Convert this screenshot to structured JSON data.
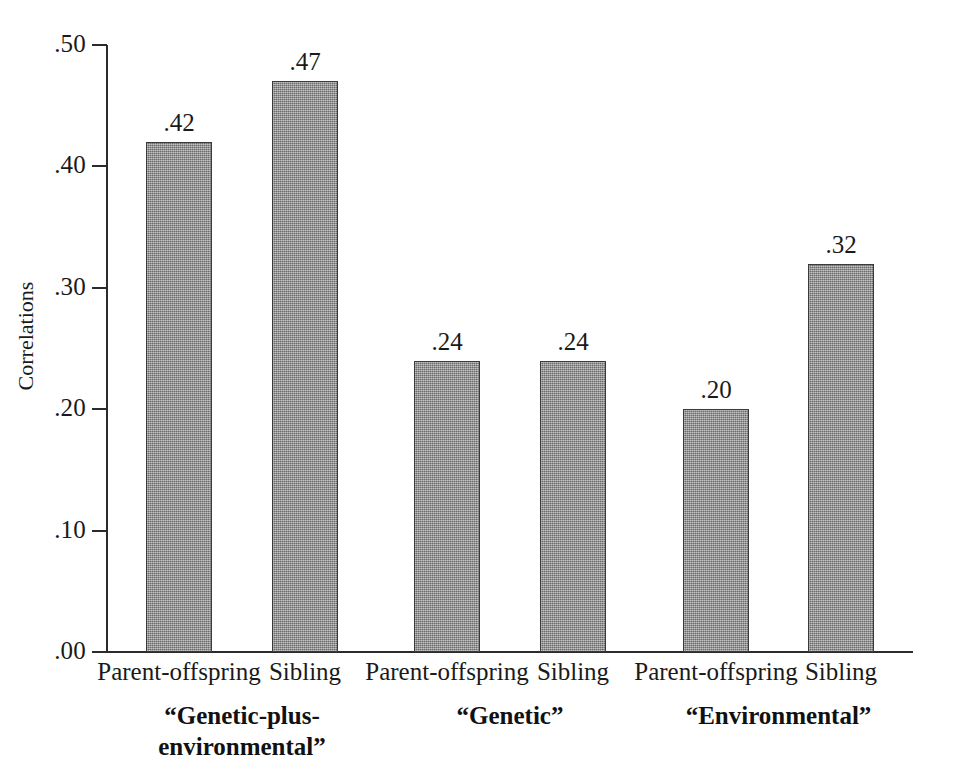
{
  "chart_data": {
    "type": "bar",
    "title": "",
    "subtitle": "",
    "xlabel": "",
    "ylabel": "Correlations",
    "ylim": [
      0.0,
      0.5
    ],
    "ytick_labels": [
      ".50",
      ".40",
      ".30",
      ".20",
      ".10",
      ".00"
    ],
    "ytick_values": [
      0.5,
      0.4,
      0.3,
      0.2,
      0.1,
      0.0
    ],
    "grid": false,
    "legend": "none",
    "categories": [
      "Parent-offspring",
      "Sibling",
      "Parent-offspring",
      "Sibling",
      "Parent-offspring",
      "Sibling"
    ],
    "values": [
      0.42,
      0.47,
      0.24,
      0.24,
      0.2,
      0.32
    ],
    "value_labels": [
      ".42",
      ".47",
      ".24",
      ".24",
      ".20",
      ".32"
    ],
    "groups": [
      {
        "label": "“Genetic-plus-\nenvironmental”",
        "label_line1": "“Genetic-plus-",
        "label_line2": "environmental”",
        "bars": [
          {
            "category": "Parent-offspring",
            "value": 0.42,
            "label": ".42"
          },
          {
            "category": "Sibling",
            "value": 0.47,
            "label": ".47"
          }
        ]
      },
      {
        "label": "“Genetic”",
        "label_line1": "“Genetic”",
        "label_line2": "",
        "bars": [
          {
            "category": "Parent-offspring",
            "value": 0.24,
            "label": ".24"
          },
          {
            "category": "Sibling",
            "value": 0.24,
            "label": ".24"
          }
        ]
      },
      {
        "label": "“Environmental”",
        "label_line1": "“Environmental”",
        "label_line2": "",
        "bars": [
          {
            "category": "Parent-offspring",
            "value": 0.2,
            "label": ".20"
          },
          {
            "category": "Sibling",
            "value": 0.32,
            "label": ".32"
          }
        ]
      }
    ],
    "bar_color": "#8a8a8a",
    "bar_edge_color": "#3a3a3a",
    "axis_color": "#2b2b2b",
    "background_color": "#ffffff"
  },
  "axis": {
    "ticks": [
      {
        "label": ".50",
        "value": 0.5
      },
      {
        "label": ".40",
        "value": 0.4
      },
      {
        "label": ".30",
        "value": 0.3
      },
      {
        "label": ".20",
        "value": 0.2
      },
      {
        "label": ".10",
        "value": 0.1
      },
      {
        "label": ".00",
        "value": 0.0
      }
    ],
    "y_title": "Correlations"
  },
  "bars": [
    {
      "label": ".42",
      "category": "Parent-offspring",
      "value": 0.42
    },
    {
      "label": ".47",
      "category": "Sibling",
      "value": 0.47
    },
    {
      "label": ".24",
      "category": "Parent-offspring",
      "value": 0.24
    },
    {
      "label": ".24",
      "category": "Sibling",
      "value": 0.24
    },
    {
      "label": ".20",
      "category": "Parent-offspring",
      "value": 0.2
    },
    {
      "label": ".32",
      "category": "Sibling",
      "value": 0.32
    }
  ],
  "group_labels": [
    {
      "line1": "“Genetic-plus-",
      "line2": "environmental”"
    },
    {
      "line1": "“Genetic”",
      "line2": ""
    },
    {
      "line1": "“Environmental”",
      "line2": ""
    }
  ]
}
